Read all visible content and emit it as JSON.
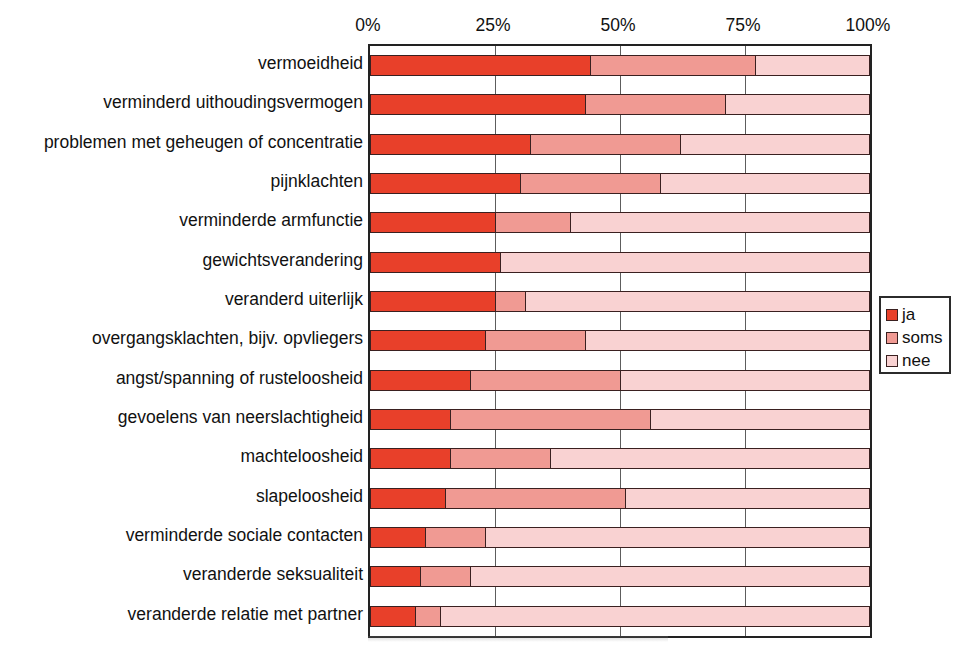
{
  "chart_data": {
    "type": "bar",
    "orientation": "horizontal",
    "stacked": true,
    "stack_mode": "percent",
    "title": "",
    "subtitle": "",
    "xlabel": "",
    "ylabel": "",
    "xlim": [
      0,
      100
    ],
    "xticks": [
      0,
      25,
      50,
      75,
      100
    ],
    "xtick_labels": [
      "0%",
      "25%",
      "50%",
      "75%",
      "100%"
    ],
    "grid": true,
    "grid_axis": "x",
    "legend_position": "right",
    "legend": [
      "ja",
      "soms",
      "nee"
    ],
    "colors": {
      "ja": "#E8402A",
      "soms": "#F09A93",
      "nee": "#F9D2D2",
      "outline": "#3A2020",
      "frame": "#222222",
      "gridline": "#5D5D5D"
    },
    "categories": [
      "vermoeidheid",
      "verminderd uithoudingsvermogen",
      "problemen met geheugen of concentratie",
      "pijnklachten",
      "verminderde armfunctie",
      "gewichtsverandering",
      "veranderd uiterlijk",
      "overgangsklachten, bijv. opvliegers",
      "angst/spanning of rusteloosheid",
      "gevoelens van neerslachtigheid",
      "machteloosheid",
      "slapeloosheid",
      "verminderde sociale contacten",
      "veranderde seksualiteit",
      "veranderde relatie met partner"
    ],
    "series": [
      {
        "name": "ja",
        "color": "#E8402A",
        "values": [
          44,
          43,
          32,
          30,
          25,
          26,
          25,
          23,
          20,
          16,
          16,
          15,
          11,
          10,
          9
        ]
      },
      {
        "name": "soms",
        "color": "#F09A93",
        "values": [
          33,
          28,
          30,
          28,
          15,
          0,
          6,
          20,
          30,
          40,
          20,
          36,
          12,
          10,
          5
        ]
      },
      {
        "name": "nee",
        "color": "#F9D2D2",
        "values": [
          23,
          29,
          38,
          42,
          60,
          74,
          69,
          57,
          50,
          44,
          64,
          49,
          77,
          80,
          86
        ]
      }
    ],
    "rows": [
      {
        "category": "vermoeidheid",
        "ja": 44,
        "soms": 33,
        "nee": 23
      },
      {
        "category": "verminderd uithoudingsvermogen",
        "ja": 43,
        "soms": 28,
        "nee": 29
      },
      {
        "category": "problemen met geheugen of concentratie",
        "ja": 32,
        "soms": 30,
        "nee": 38
      },
      {
        "category": "pijnklachten",
        "ja": 30,
        "soms": 28,
        "nee": 42
      },
      {
        "category": "verminderde armfunctie",
        "ja": 25,
        "soms": 15,
        "nee": 60
      },
      {
        "category": "gewichtsverandering",
        "ja": 26,
        "soms": 0,
        "nee": 74
      },
      {
        "category": "veranderd uiterlijk",
        "ja": 25,
        "soms": 6,
        "nee": 69
      },
      {
        "category": "overgangsklachten, bijv. opvliegers",
        "ja": 23,
        "soms": 20,
        "nee": 57
      },
      {
        "category": "angst/spanning of rusteloosheid",
        "ja": 20,
        "soms": 30,
        "nee": 50
      },
      {
        "category": "gevoelens van neerslachtigheid",
        "ja": 16,
        "soms": 40,
        "nee": 44
      },
      {
        "category": "machteloosheid",
        "ja": 16,
        "soms": 20,
        "nee": 64
      },
      {
        "category": "slapeloosheid",
        "ja": 15,
        "soms": 36,
        "nee": 49
      },
      {
        "category": "verminderde sociale contacten",
        "ja": 11,
        "soms": 12,
        "nee": 77
      },
      {
        "category": "veranderde seksualiteit",
        "ja": 10,
        "soms": 10,
        "nee": 80
      },
      {
        "category": "veranderde relatie met partner",
        "ja": 9,
        "soms": 5,
        "nee": 86
      }
    ]
  }
}
